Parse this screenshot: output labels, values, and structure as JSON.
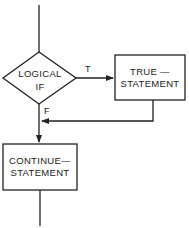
{
  "diagram": {
    "type": "flowchart",
    "colors": {
      "stroke": "#222222",
      "background": "#ffffff"
    },
    "nodes": {
      "decision": {
        "shape": "diamond",
        "line1": "LOGICAL",
        "line2": "IF"
      },
      "true_statement": {
        "shape": "rectangle",
        "line1": "TRUE —",
        "line2": "STATEMENT"
      },
      "continue_statement": {
        "shape": "rectangle",
        "line1": "CONTINUE—",
        "line2": "STATEMENT"
      }
    },
    "edges": {
      "true_label": "T",
      "false_label": "F"
    }
  }
}
